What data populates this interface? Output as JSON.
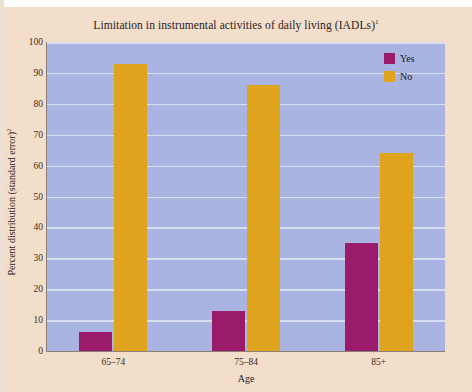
{
  "chart_data": {
    "type": "bar",
    "title": "Limitation in instrumental activities of daily living (IADLs)",
    "title_superscript": "1",
    "xlabel": "Age",
    "ylabel": "Percent distribution (standard error)",
    "ylabel_superscript": "2",
    "categories": [
      "65–74",
      "75–84",
      "85+"
    ],
    "series": [
      {
        "name": "Yes",
        "color": "#9b1b6b",
        "values": [
          6,
          13,
          35
        ]
      },
      {
        "name": "No",
        "color": "#dfa31e",
        "values": [
          93,
          86,
          64
        ]
      }
    ],
    "ylim": [
      0,
      100
    ],
    "yticks": [
      0,
      10,
      20,
      30,
      40,
      50,
      60,
      70,
      80,
      90,
      100
    ],
    "ytick_labels": [
      "0",
      "10",
      "20",
      "30",
      "40",
      "50",
      "60",
      "70",
      "80",
      "90",
      "100"
    ],
    "grid": true,
    "legend_position": "top-right",
    "plot_background": "#a9b4e2",
    "figure_background": "#f3decc",
    "gridline_color": "#d7deef"
  }
}
